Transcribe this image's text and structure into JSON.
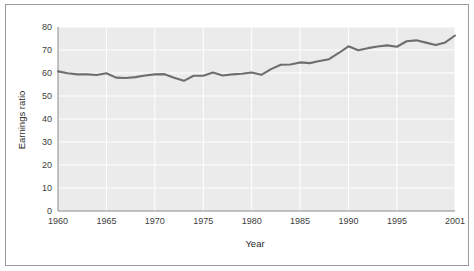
{
  "chart_data": {
    "type": "line",
    "title": "",
    "xlabel": "Year",
    "ylabel": "Earnings ratio",
    "xlim": [
      1960,
      2001
    ],
    "ylim": [
      0,
      80
    ],
    "grid": true,
    "legend": "none",
    "xticks": [
      1960,
      1965,
      1970,
      1975,
      1980,
      1985,
      1990,
      1995,
      2001
    ],
    "xticklabels": [
      "1960",
      "1965",
      "1970",
      "1975",
      "1980",
      "1985",
      "1990",
      "1995",
      "2001"
    ],
    "yticks": [
      0,
      10,
      20,
      30,
      40,
      50,
      60,
      70,
      80
    ],
    "yticklabels": [
      "0",
      "10",
      "20",
      "30",
      "40",
      "50",
      "60",
      "70",
      "80"
    ],
    "series": [
      {
        "name": "Earnings ratio",
        "color": "#6e6e6e",
        "x": [
          1960,
          1961,
          1962,
          1963,
          1964,
          1965,
          1966,
          1967,
          1968,
          1969,
          1970,
          1971,
          1972,
          1973,
          1974,
          1975,
          1976,
          1977,
          1978,
          1979,
          1980,
          1981,
          1982,
          1983,
          1984,
          1985,
          1986,
          1987,
          1988,
          1989,
          1990,
          1991,
          1992,
          1993,
          1994,
          1995,
          1996,
          1997,
          1998,
          1999,
          2000,
          2001
        ],
        "values": [
          60.7,
          59.9,
          59.4,
          59.4,
          59.1,
          59.9,
          58.0,
          57.8,
          58.2,
          58.9,
          59.4,
          59.5,
          57.9,
          56.6,
          58.8,
          58.8,
          60.2,
          58.9,
          59.4,
          59.7,
          60.2,
          59.2,
          61.7,
          63.6,
          63.7,
          64.6,
          64.3,
          65.2,
          66.0,
          68.7,
          71.6,
          69.9,
          70.8,
          71.5,
          72.0,
          71.4,
          73.8,
          74.2,
          73.2,
          72.2,
          73.3,
          76.3
        ]
      }
    ]
  },
  "axes": {
    "y_title": "Earnings ratio",
    "x_title": "Year"
  }
}
